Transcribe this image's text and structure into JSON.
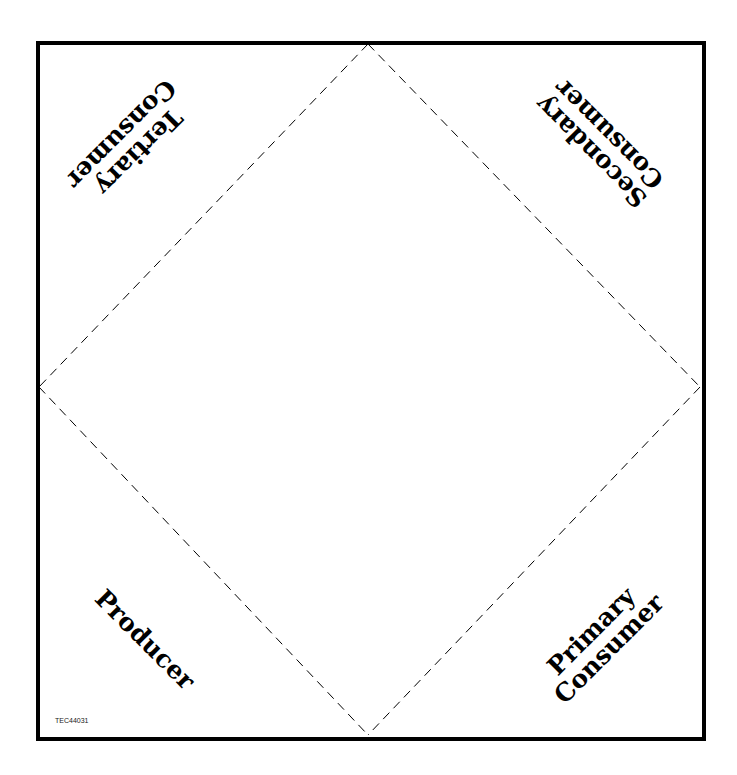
{
  "sheet": {
    "labels": {
      "tertiary": [
        "Tertiary",
        "Consumer"
      ],
      "secondary": [
        "Secondary",
        "Consumer"
      ],
      "producer": [
        "Producer"
      ],
      "primary": [
        "Primary",
        "Consumer"
      ]
    },
    "code": "TEC44031",
    "colors": {
      "ink": "#000000",
      "paper": "#ffffff"
    }
  }
}
